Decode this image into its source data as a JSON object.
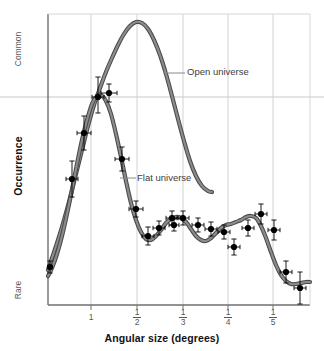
{
  "chart_data": {
    "type": "line",
    "title": "",
    "xlabel": "Angular size (degrees)",
    "ylabel": "Occurrence",
    "grid": true,
    "legend_position": "inline-annotations",
    "xtick_labels": [
      "1",
      "1/2",
      "1/3",
      "1/4",
      "1/5"
    ],
    "xtick_numerators": [
      "",
      "1",
      "1",
      "1",
      "1"
    ],
    "xtick_denominators": [
      "",
      "2",
      "3",
      "4",
      "5"
    ],
    "ytick_labels": [
      "Common",
      "Rare"
    ],
    "ylim_labels": {
      "top": "Common",
      "bottom": "Rare"
    },
    "annotations": [
      {
        "text": "Open universe",
        "points_to": "open-universe-curve"
      },
      {
        "text": "Flat universe",
        "points_to": "flat-universe-curve"
      }
    ],
    "series": [
      {
        "name": "Open universe",
        "kind": "model-curve-band",
        "color": "#6d6d6d",
        "points": [
          [
            48,
            270
          ],
          [
            52,
            258
          ],
          [
            58,
            240
          ],
          [
            64,
            220
          ],
          [
            70,
            198
          ],
          [
            76,
            174
          ],
          [
            82,
            150
          ],
          [
            88,
            126
          ],
          [
            94,
            105
          ],
          [
            100,
            88
          ],
          [
            106,
            72
          ],
          [
            112,
            58
          ],
          [
            118,
            45
          ],
          [
            124,
            34
          ],
          [
            130,
            26
          ],
          [
            136,
            22
          ],
          [
            142,
            23
          ],
          [
            148,
            29
          ],
          [
            154,
            40
          ],
          [
            160,
            55
          ],
          [
            166,
            74
          ],
          [
            172,
            96
          ],
          [
            178,
            119
          ],
          [
            184,
            141
          ],
          [
            190,
            161
          ],
          [
            196,
            176
          ],
          [
            202,
            186
          ],
          [
            208,
            191
          ],
          [
            212,
            192
          ]
        ]
      },
      {
        "name": "Flat universe",
        "kind": "model-curve-band",
        "color": "#6d6d6d",
        "points": [
          [
            48,
            276
          ],
          [
            52,
            268
          ],
          [
            57,
            254
          ],
          [
            62,
            236
          ],
          [
            67,
            214
          ],
          [
            72,
            190
          ],
          [
            77,
            164
          ],
          [
            82,
            140
          ],
          [
            87,
            120
          ],
          [
            92,
            104
          ],
          [
            97,
            96
          ],
          [
            101,
            95
          ],
          [
            106,
            101
          ],
          [
            111,
            114
          ],
          [
            116,
            134
          ],
          [
            121,
            157
          ],
          [
            126,
            181
          ],
          [
            131,
            203
          ],
          [
            136,
            220
          ],
          [
            141,
            232
          ],
          [
            146,
            239
          ],
          [
            151,
            240
          ],
          [
            156,
            236
          ],
          [
            161,
            230
          ],
          [
            166,
            223
          ],
          [
            171,
            219
          ],
          [
            176,
            217
          ],
          [
            181,
            218
          ],
          [
            186,
            222
          ],
          [
            191,
            229
          ],
          [
            196,
            236
          ],
          [
            201,
            240
          ],
          [
            206,
            241
          ],
          [
            211,
            238
          ],
          [
            216,
            233
          ],
          [
            221,
            228
          ],
          [
            226,
            225
          ],
          [
            231,
            224
          ],
          [
            236,
            222
          ],
          [
            241,
            220
          ],
          [
            246,
            217
          ],
          [
            251,
            216
          ],
          [
            256,
            218
          ],
          [
            261,
            226
          ],
          [
            266,
            238
          ],
          [
            271,
            252
          ],
          [
            276,
            265
          ],
          [
            281,
            275
          ],
          [
            286,
            281
          ],
          [
            291,
            284
          ],
          [
            296,
            284
          ],
          [
            301,
            283
          ],
          [
            306,
            282
          ],
          [
            310,
            282
          ]
        ]
      },
      {
        "name": "Observations",
        "kind": "scatter-errorbars",
        "color": "#000000",
        "points": [
          {
            "x": 50,
            "y": 267,
            "yerr_up": 6,
            "yerr_dn": 6,
            "xerr": 2
          },
          {
            "x": 72,
            "y": 179,
            "yerr_up": 18,
            "yerr_dn": 18,
            "xerr": 6
          },
          {
            "x": 84,
            "y": 133,
            "yerr_up": 17,
            "yerr_dn": 17,
            "xerr": 7
          },
          {
            "x": 98,
            "y": 97,
            "yerr_up": 20,
            "yerr_dn": 16,
            "xerr": 6
          },
          {
            "x": 109,
            "y": 93,
            "yerr_up": 9,
            "yerr_dn": 9,
            "xerr": 8
          },
          {
            "x": 122,
            "y": 159,
            "yerr_up": 12,
            "yerr_dn": 12,
            "xerr": 7
          },
          {
            "x": 136,
            "y": 209,
            "yerr_up": 8,
            "yerr_dn": 8,
            "xerr": 7
          },
          {
            "x": 148,
            "y": 236,
            "yerr_up": 9,
            "yerr_dn": 9,
            "xerr": 6
          },
          {
            "x": 159,
            "y": 228,
            "yerr_up": 7,
            "yerr_dn": 7,
            "xerr": 6
          },
          {
            "x": 172,
            "y": 218,
            "yerr_up": 7,
            "yerr_dn": 7,
            "xerr": 6
          },
          {
            "x": 183,
            "y": 218,
            "yerr_up": 7,
            "yerr_dn": 7,
            "xerr": 6
          },
          {
            "x": 174,
            "y": 225,
            "yerr_up": 6,
            "yerr_dn": 6,
            "xerr": 5
          },
          {
            "x": 198,
            "y": 225,
            "yerr_up": 7,
            "yerr_dn": 7,
            "xerr": 6
          },
          {
            "x": 211,
            "y": 229,
            "yerr_up": 7,
            "yerr_dn": 7,
            "xerr": 6
          },
          {
            "x": 224,
            "y": 232,
            "yerr_up": 7,
            "yerr_dn": 7,
            "xerr": 6
          },
          {
            "x": 234,
            "y": 247,
            "yerr_up": 8,
            "yerr_dn": 8,
            "xerr": 6
          },
          {
            "x": 248,
            "y": 228,
            "yerr_up": 8,
            "yerr_dn": 8,
            "xerr": 6
          },
          {
            "x": 261,
            "y": 214,
            "yerr_up": 10,
            "yerr_dn": 10,
            "xerr": 6
          },
          {
            "x": 274,
            "y": 230,
            "yerr_up": 10,
            "yerr_dn": 10,
            "xerr": 6
          },
          {
            "x": 286,
            "y": 272,
            "yerr_up": 11,
            "yerr_dn": 11,
            "xerr": 6
          },
          {
            "x": 300,
            "y": 288,
            "yerr_up": 16,
            "yerr_dn": 16,
            "xerr": 6
          }
        ]
      }
    ],
    "vertical_gridlines_x": [
      91,
      137,
      183,
      228,
      273
    ],
    "horizontal_gridlines_y": [
      97
    ]
  },
  "colors": {
    "curve": "#6d6d6d",
    "curve_edge": "#3a3a3a",
    "data_point": "#000000",
    "grid": "#d0d0d0",
    "frame": "#7a7a7a",
    "tick_text": "#585858",
    "axis_title": "#121212",
    "background": "#ffffff"
  }
}
